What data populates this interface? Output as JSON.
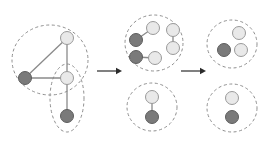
{
  "figure": {
    "width": 269,
    "height": 142,
    "background_color": "#ffffff",
    "node_light_color": "#e9e9e9",
    "node_dark_color": "#7a7a7a",
    "node_stroke_color": "#9a9a9a",
    "edge_color": "#8a8a8a",
    "outline_color": "#8f8f8f",
    "arrow_color": "#2b2b2b",
    "node_radius": 6.5
  },
  "stages": [
    {
      "name": "stage-1-original-graph",
      "label": "",
      "groups": [
        {
          "name": "group-large-circle",
          "shape": "ellipse",
          "cx": 50,
          "cy": 60,
          "rx": 38,
          "ry": 35,
          "rotation": 0
        },
        {
          "name": "group-vertical-ellipse",
          "shape": "ellipse",
          "cx": 67,
          "cy": 98,
          "rx": 17,
          "ry": 34,
          "rotation": 0
        }
      ],
      "nodes": [
        {
          "name": "node-a",
          "cx": 67,
          "cy": 38,
          "type": "light"
        },
        {
          "name": "node-b",
          "cx": 25,
          "cy": 78,
          "type": "dark"
        },
        {
          "name": "node-c",
          "cx": 67,
          "cy": 78,
          "type": "light"
        },
        {
          "name": "node-d",
          "cx": 67,
          "cy": 116,
          "type": "dark"
        }
      ],
      "edges": [
        {
          "name": "edge-a-b",
          "from": "node-a",
          "to": "node-b"
        },
        {
          "name": "edge-a-c",
          "from": "node-a",
          "to": "node-c"
        },
        {
          "name": "edge-b-c",
          "from": "node-b",
          "to": "node-c"
        },
        {
          "name": "edge-c-d",
          "from": "node-c",
          "to": "node-d"
        }
      ]
    },
    {
      "name": "stage-2-split-clusters",
      "label": "",
      "groups": [
        {
          "name": "group-upper-cluster",
          "shape": "ellipse",
          "cx": 154,
          "cy": 43,
          "rx": 29,
          "ry": 28,
          "rotation": 0
        },
        {
          "name": "group-lower-cluster",
          "shape": "ellipse",
          "cx": 152,
          "cy": 107,
          "rx": 25,
          "ry": 24,
          "rotation": 0
        }
      ],
      "nodes": [
        {
          "name": "node-a",
          "cx": 153,
          "cy": 28,
          "type": "light"
        },
        {
          "name": "node-b",
          "cx": 136,
          "cy": 40,
          "type": "dark"
        },
        {
          "name": "node-e",
          "cx": 136,
          "cy": 57,
          "type": "dark"
        },
        {
          "name": "node-f",
          "cx": 155,
          "cy": 58,
          "type": "light"
        },
        {
          "name": "node-g",
          "cx": 173,
          "cy": 30,
          "type": "light"
        },
        {
          "name": "node-h",
          "cx": 173,
          "cy": 48,
          "type": "light"
        },
        {
          "name": "node-c",
          "cx": 152,
          "cy": 97,
          "type": "light"
        },
        {
          "name": "node-d",
          "cx": 152,
          "cy": 117,
          "type": "dark"
        }
      ],
      "edges": [
        {
          "name": "edge-a-b",
          "from": "node-a",
          "to": "node-b"
        },
        {
          "name": "edge-e-f",
          "from": "node-e",
          "to": "node-f"
        },
        {
          "name": "edge-g-h",
          "from": "node-g",
          "to": "node-h"
        },
        {
          "name": "edge-c-d",
          "from": "node-c",
          "to": "node-d"
        }
      ]
    },
    {
      "name": "stage-3-final-clusters",
      "label": "",
      "groups": [
        {
          "name": "group-upper-cluster",
          "shape": "ellipse",
          "cx": 232,
          "cy": 44,
          "rx": 25,
          "ry": 24,
          "rotation": 0
        },
        {
          "name": "group-lower-cluster",
          "shape": "ellipse",
          "cx": 232,
          "cy": 108,
          "rx": 25,
          "ry": 24,
          "rotation": 0
        }
      ],
      "nodes": [
        {
          "name": "node-a",
          "cx": 239,
          "cy": 33,
          "type": "light"
        },
        {
          "name": "node-b",
          "cx": 224,
          "cy": 50,
          "type": "dark"
        },
        {
          "name": "node-f",
          "cx": 241,
          "cy": 50,
          "type": "light"
        },
        {
          "name": "node-c",
          "cx": 232,
          "cy": 98,
          "type": "light"
        },
        {
          "name": "node-d",
          "cx": 232,
          "cy": 117,
          "type": "dark"
        }
      ],
      "edges": []
    }
  ],
  "arrows": [
    {
      "name": "arrow-stage1-to-stage2",
      "x1": 97,
      "y1": 71,
      "x2": 122,
      "y2": 71
    },
    {
      "name": "arrow-stage2-to-stage3",
      "x1": 181,
      "y1": 71,
      "x2": 206,
      "y2": 71
    }
  ]
}
